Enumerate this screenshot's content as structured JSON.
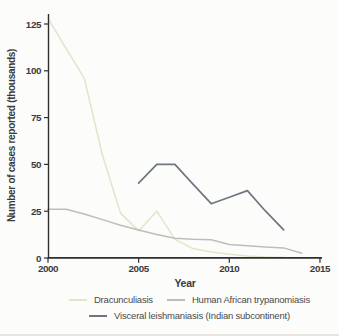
{
  "figure": {
    "background": "#fcfcfa",
    "axis_color": "#2f2f2f",
    "text_color": "#3a3a3a",
    "bottom_edge_color": "#d8d2c6"
  },
  "chart_data": {
    "type": "line",
    "title": "",
    "xlabel": "Year",
    "ylabel": "Number of cases reported (thousands)",
    "xlim": [
      2000,
      2015
    ],
    "ylim": [
      0,
      130
    ],
    "x_ticks": [
      2000,
      2005,
      2010,
      2015
    ],
    "y_ticks": [
      0,
      25,
      50,
      75,
      100,
      125
    ],
    "grid": false,
    "legend_position": "bottom",
    "series": [
      {
        "name": "Dracunculiasis",
        "slug": "dracunculiasis",
        "color": "#e4e4cb",
        "stroke_width": 1.5,
        "x": [
          2000,
          2001,
          2002,
          2003,
          2004,
          2005,
          2006,
          2007,
          2008,
          2009,
          2010,
          2011,
          2012,
          2013
        ],
        "values": [
          128,
          112,
          96,
          55,
          24,
          14.5,
          25,
          10,
          5,
          3.2,
          2,
          1.1,
          0.5,
          0.2
        ]
      },
      {
        "name": "Human African trypanomiasis",
        "slug": "human-african-trypanomiasis",
        "color": "#bdbdbd",
        "stroke_width": 1.5,
        "x": [
          2000,
          2001,
          2002,
          2003,
          2004,
          2005,
          2006,
          2007,
          2008,
          2009,
          2010,
          2011,
          2012,
          2013,
          2014
        ],
        "values": [
          26,
          26,
          23.5,
          20.5,
          17.5,
          15,
          12.5,
          10.5,
          10,
          9.8,
          7.2,
          6.5,
          5.8,
          5.4,
          2.5
        ]
      },
      {
        "name": "Visceral leishmaniasis (Indian subcontinent)",
        "slug": "visceral-leishmaniasis-indian-subcontinent",
        "color": "#6d7782",
        "stroke_width": 1.7,
        "x": [
          2005,
          2006,
          2007,
          2008,
          2009,
          2010,
          2011,
          2012,
          2013
        ],
        "values": [
          40,
          50,
          50,
          39.5,
          29,
          32.5,
          36,
          25,
          15
        ]
      }
    ]
  }
}
